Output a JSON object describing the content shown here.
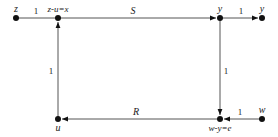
{
  "diagram": {
    "type": "signal-flow-graph",
    "nodes": [
      {
        "id": "z",
        "label": "z",
        "x": 16,
        "y": 18
      },
      {
        "id": "zux",
        "label": "z-u=x",
        "x": 58,
        "y": 18
      },
      {
        "id": "y1",
        "label": "y",
        "x": 220,
        "y": 18
      },
      {
        "id": "y2",
        "label": "y",
        "x": 262,
        "y": 18
      },
      {
        "id": "u",
        "label": "u",
        "x": 58,
        "y": 119
      },
      {
        "id": "wye",
        "label": "w-y=e",
        "x": 220,
        "y": 119
      },
      {
        "id": "w",
        "label": "w",
        "x": 262,
        "y": 119
      }
    ],
    "edges": [
      {
        "from": "z",
        "to": "zux",
        "gain": "1"
      },
      {
        "from": "zux",
        "to": "y1",
        "gain": "S"
      },
      {
        "from": "y1",
        "to": "y2",
        "gain": "1"
      },
      {
        "from": "y1",
        "to": "wye",
        "gain": "1"
      },
      {
        "from": "w",
        "to": "wye",
        "gain": "1"
      },
      {
        "from": "wye",
        "to": "u",
        "gain": "R"
      },
      {
        "from": "u",
        "to": "zux",
        "gain": "1"
      }
    ]
  },
  "labels": {
    "node_z": "z",
    "node_zux": "z-u=x",
    "node_y1": "y",
    "node_y2": "y",
    "node_u": "u",
    "node_wye": "w-y=e",
    "node_w": "w",
    "gain_z_zux": "1",
    "gain_S": "S",
    "gain_y_y": "1",
    "gain_y_e": "1",
    "gain_w_e": "1",
    "gain_R": "R",
    "gain_u_x": "1"
  },
  "colors": {
    "line": "#555555",
    "node": "#111111",
    "text": "#222222"
  }
}
